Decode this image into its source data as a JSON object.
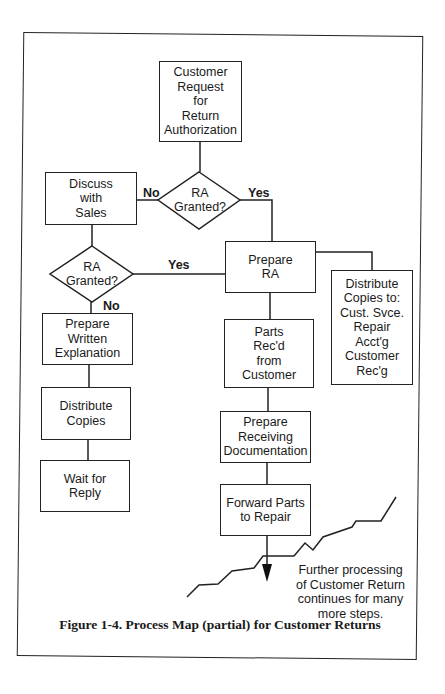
{
  "figure": {
    "caption": "Figure 1-4. Process Map (partial) for Customer Returns"
  },
  "nodes": {
    "customer_request": "Customer\nRequest\nfor\nReturn\nAuthorization",
    "decision_1": "RA\nGranted?",
    "discuss_with_sales": "Discuss\nwith\nSales",
    "decision_2": "RA\nGranted?",
    "prepare_ra": "Prepare\nRA",
    "distribute_copies_to": "Distribute\nCopies to:\nCust. Svce.\nRepair\nAcct'g\nCustomer\nRec'g",
    "prepare_written_explanation": "Prepare\nWritten\nExplanation",
    "parts_received": "Parts\nRec'd\nfrom\nCustomer",
    "distribute_copies": "Distribute\nCopies",
    "prepare_receiving_documentation": "Prepare\nReceiving\nDocumentation",
    "wait_for_reply": "Wait for\nReply",
    "forward_parts": "Forward Parts\nto Repair"
  },
  "edges": {
    "decision_1_no": "No",
    "decision_1_yes": "Yes",
    "decision_2_yes": "Yes",
    "decision_2_no": "No"
  },
  "annotation": {
    "further_processing": "Further processing\nof Customer Return\ncontinues for many\nmore steps."
  }
}
